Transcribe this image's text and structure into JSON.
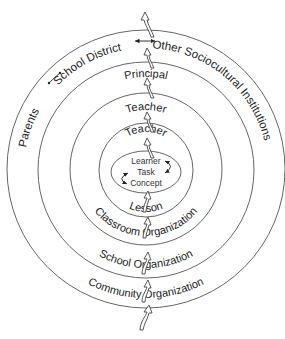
{
  "diagram": {
    "type": "concentric-circles",
    "center": [
      146,
      170
    ],
    "rings": [
      {
        "name": "community-ring",
        "radius": 139
      },
      {
        "name": "school-ring",
        "radius": 109
      },
      {
        "name": "classroom-ring",
        "radius": 76
      },
      {
        "name": "lesson-ring",
        "radius": 47
      }
    ],
    "core": {
      "shape": "ellipse",
      "rx": 35,
      "ry": 21
    }
  },
  "labels": {
    "parents": "Parents",
    "school_district": "School District",
    "other_institutions": "Other Sociocultural Institutions",
    "principal": "Principal",
    "teacher_outer": "Teacher",
    "teacher_inner": "Teacher",
    "core_learner": "Learner",
    "core_task": "Task",
    "core_concept": "Concept",
    "lesson": "Lesson",
    "classroom_org": "Classroom Organization",
    "school_org": "School Organization",
    "community_org": "Community Organization"
  },
  "colors": {
    "stroke": "#555555",
    "text": "#222222",
    "background": "#ffffff"
  }
}
